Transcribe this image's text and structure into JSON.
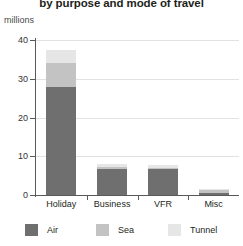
{
  "chart_data": {
    "type": "bar",
    "subtype": "stacked",
    "title": "by purpose and mode of travel",
    "unit_label": "millions",
    "xlabel": "",
    "ylabel": "millions",
    "ylim": [
      0,
      40
    ],
    "yticks": [
      0,
      10,
      20,
      30,
      40
    ],
    "grid": true,
    "legend_position": "bottom",
    "categories": [
      "Holiday",
      "Business",
      "VFR",
      "Misc"
    ],
    "series": [
      {
        "name": "Air",
        "color": "#6f6f6f",
        "values": [
          28.0,
          6.7,
          6.6,
          0.6
        ]
      },
      {
        "name": "Sea",
        "color": "#c3c3c3",
        "values": [
          6.0,
          0.6,
          0.5,
          0.6
        ]
      },
      {
        "name": "Tunnel",
        "color": "#e6e6e6",
        "values": [
          3.5,
          0.8,
          0.7,
          0.4
        ]
      }
    ]
  },
  "axis": {
    "tick_labels": [
      "40",
      "30",
      "20",
      "10",
      "0"
    ]
  },
  "legend": {
    "items": [
      {
        "label": "Air"
      },
      {
        "label": "Sea"
      },
      {
        "label": "Tunnel"
      }
    ]
  }
}
